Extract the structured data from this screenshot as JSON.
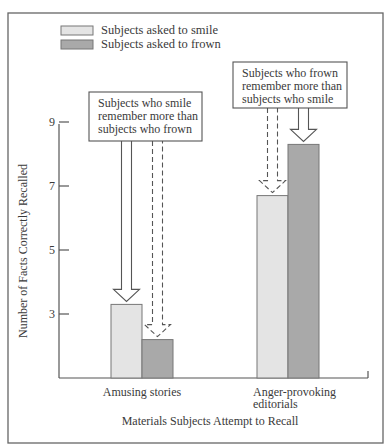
{
  "chart_data": {
    "type": "bar",
    "title": "",
    "xlabel": "Materials Subjects Attempt to Recall",
    "ylabel": "Number of Facts Correctly Recalled",
    "categories": [
      "Amusing stories",
      "Anger-provoking editorials"
    ],
    "category_lines": [
      [
        "Amusing stories"
      ],
      [
        "Anger-provoking",
        "editorials"
      ]
    ],
    "series": [
      {
        "name": "Subjects asked to smile",
        "color": "#e4e4e4",
        "values": [
          3.3,
          6.7
        ]
      },
      {
        "name": "Subjects asked to frown",
        "color": "#a9a9a9",
        "values": [
          2.2,
          8.3
        ]
      }
    ],
    "yticks": [
      3,
      5,
      7,
      9
    ],
    "ylim": [
      1,
      9
    ],
    "grid": false,
    "legend_position": "top-left",
    "annotations": [
      {
        "lines": [
          "Subjects who smile",
          "remember more than",
          "subjects who frown"
        ],
        "category": 0
      },
      {
        "lines": [
          "Subjects who frown",
          "remember more than",
          "subjects who smile"
        ],
        "category": 1
      }
    ]
  },
  "colors": {
    "frame": "#555555",
    "axis": "#555555",
    "text": "#3a3a3a"
  }
}
